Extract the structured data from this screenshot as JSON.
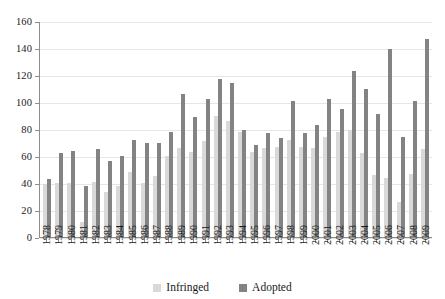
{
  "chart_data": {
    "type": "bar",
    "title": "",
    "subtitle": "",
    "xlabel": "",
    "ylabel": "",
    "grid": true,
    "legend_position": "bottom-center",
    "ylim": [
      0,
      160
    ],
    "ytick_labels": [
      "160",
      "140",
      "120",
      "100",
      "80",
      "60",
      "40",
      "20",
      "0"
    ],
    "yticks": [
      160,
      140,
      120,
      100,
      80,
      60,
      40,
      20,
      0
    ],
    "categories": [
      "1978",
      "1979",
      "1980",
      "1981",
      "1982",
      "1983",
      "1984",
      "1985",
      "1986",
      "1987",
      "1988",
      "1989",
      "1990",
      "1991",
      "1992",
      "1993",
      "1994",
      "1995",
      "1996",
      "1997",
      "1998",
      "1999",
      "2000",
      "2001",
      "2002",
      "2003",
      "2004",
      "2005",
      "2006",
      "2007",
      "2008",
      "2009"
    ],
    "series": [
      {
        "name": "Infringed",
        "color": "#d9d9d9",
        "values": [
          39,
          40,
          40,
          11,
          41,
          33,
          38,
          48,
          40,
          45,
          60,
          66,
          63,
          71,
          90,
          86,
          78,
          63,
          66,
          67,
          72,
          67,
          66,
          74,
          78,
          79,
          62,
          46,
          44,
          26,
          47,
          65
        ]
      },
      {
        "name": "Adopted",
        "color": "#838383",
        "values": [
          43,
          62,
          64,
          38,
          65,
          56,
          60,
          72,
          70,
          70,
          78,
          106,
          89,
          102,
          117,
          114,
          79,
          68,
          77,
          73,
          101,
          77,
          83,
          102,
          95,
          123,
          110,
          91,
          139,
          74,
          101,
          147
        ]
      }
    ]
  },
  "legend": {
    "items": [
      {
        "label": "Infringed",
        "color": "#d9d9d9"
      },
      {
        "label": "Adopted",
        "color": "#838383"
      }
    ]
  }
}
